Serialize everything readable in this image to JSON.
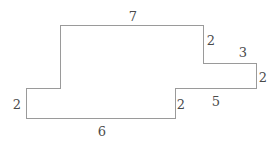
{
  "figure": {
    "type": "rectilinear-polygon",
    "stroke_color": "#9a9a9a",
    "stroke_width": 1,
    "fill_color": "#ffffff",
    "background_color": "#ffffff",
    "label_color": "#4a4a4a",
    "vertices": [
      {
        "x": 60,
        "y": 25
      },
      {
        "x": 203,
        "y": 25
      },
      {
        "x": 203,
        "y": 63
      },
      {
        "x": 256,
        "y": 63
      },
      {
        "x": 256,
        "y": 88
      },
      {
        "x": 175,
        "y": 88
      },
      {
        "x": 175,
        "y": 118
      },
      {
        "x": 26,
        "y": 118
      },
      {
        "x": 26,
        "y": 88
      },
      {
        "x": 60,
        "y": 88
      }
    ],
    "path": "M 60 25 L 203 25 L 203 63 L 256 63 L 256 88 L 175 88 L 175 118 L 26 118 L 26 88 L 60 88 Z",
    "labels": [
      {
        "name": "top-edge",
        "text": "7",
        "x": 133,
        "y": 16,
        "edge": "top",
        "orientation": "horizontal"
      },
      {
        "name": "upper-right-drop",
        "text": "2",
        "x": 211,
        "y": 40,
        "edge": "right-upper",
        "orientation": "vertical"
      },
      {
        "name": "right-top-edge",
        "text": "3",
        "x": 243,
        "y": 52,
        "edge": "right-top",
        "orientation": "horizontal"
      },
      {
        "name": "far-right-edge",
        "text": "2",
        "x": 263,
        "y": 77,
        "edge": "far-right",
        "orientation": "vertical"
      },
      {
        "name": "lower-right-edge",
        "text": "5",
        "x": 216,
        "y": 101,
        "edge": "bottom-right",
        "orientation": "horizontal"
      },
      {
        "name": "middle-step-drop",
        "text": "2",
        "x": 181,
        "y": 104,
        "edge": "middle-step",
        "orientation": "vertical"
      },
      {
        "name": "bottom-edge",
        "text": "6",
        "x": 102,
        "y": 131,
        "edge": "bottom",
        "orientation": "horizontal"
      },
      {
        "name": "left-edge",
        "text": "2",
        "x": 17,
        "y": 104,
        "edge": "left",
        "orientation": "vertical"
      }
    ]
  }
}
